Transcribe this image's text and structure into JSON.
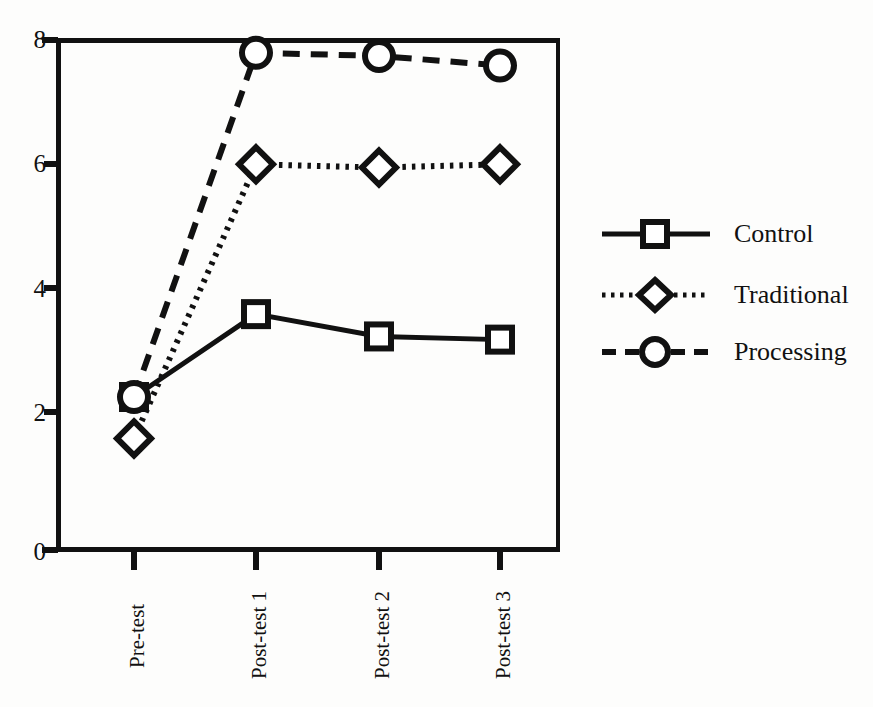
{
  "chart_data": {
    "type": "line",
    "title": "",
    "xlabel": "",
    "ylabel": "",
    "categories": [
      "Pre-test",
      "Post-test 1",
      "Post-test 2",
      "Post-test 3"
    ],
    "ylim": [
      0,
      8
    ],
    "y_ticks": [
      0,
      2,
      4,
      6,
      8
    ],
    "grid": false,
    "legend_position": "right",
    "series": [
      {
        "name": "Control",
        "marker": "square",
        "line_style": "solid",
        "color": "#111111",
        "values": [
          2.4,
          3.7,
          3.35,
          3.3
        ]
      },
      {
        "name": "Traditional",
        "marker": "diamond",
        "line_style": "dotted",
        "color": "#111111",
        "values": [
          1.75,
          6.05,
          6.0,
          6.05
        ]
      },
      {
        "name": "Processing",
        "marker": "circle",
        "line_style": "dashed",
        "color": "#111111",
        "values": [
          2.4,
          7.8,
          7.75,
          7.6
        ]
      }
    ]
  },
  "axes": {
    "y_tick_labels": [
      "8",
      "6",
      "4",
      "2",
      "0"
    ],
    "x_tick_labels": [
      "Pre-test",
      "Post-test 1",
      "Post-test 2",
      "Post-test 3"
    ]
  },
  "legend": {
    "entries": [
      {
        "label": "Control",
        "marker": "square-marker",
        "line": "solid-line"
      },
      {
        "label": "Traditional",
        "marker": "diamond-marker",
        "line": "dotted-line"
      },
      {
        "label": "Processing",
        "marker": "circle-marker",
        "line": "dashed-line"
      }
    ]
  },
  "caption": {
    "text": ""
  },
  "colors": {
    "ink": "#111111",
    "page": "#fdfdfc"
  }
}
